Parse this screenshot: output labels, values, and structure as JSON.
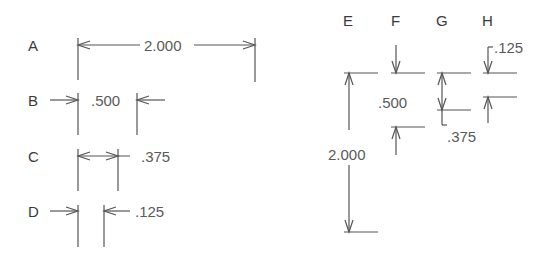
{
  "diagram": {
    "title": "",
    "horizontal_examples": [
      {
        "label": "A",
        "dimension": "2.000",
        "style": "arrows inside, text inline"
      },
      {
        "label": "B",
        "dimension": ".500",
        "style": "arrows outside pointing in, text inside"
      },
      {
        "label": "C",
        "dimension": ".375",
        "style": "arrows inside, text outside"
      },
      {
        "label": "D",
        "dimension": ".125",
        "style": "arrows outside pointing in, text outside"
      }
    ],
    "vertical_examples": [
      {
        "label": "E",
        "dimension": "2.000",
        "style": "arrows inside, text inline"
      },
      {
        "label": "F",
        "dimension": ".500",
        "style": "arrows outside pointing in, text inside"
      },
      {
        "label": "G",
        "dimension": ".375",
        "style": "arrows inside, text outside with leader"
      },
      {
        "label": "H",
        "dimension": ".125",
        "style": "arrows outside pointing in, text with leader"
      }
    ],
    "colors": {
      "line": "#555555",
      "text": "#3a3a3a",
      "background": "#ffffff"
    }
  }
}
